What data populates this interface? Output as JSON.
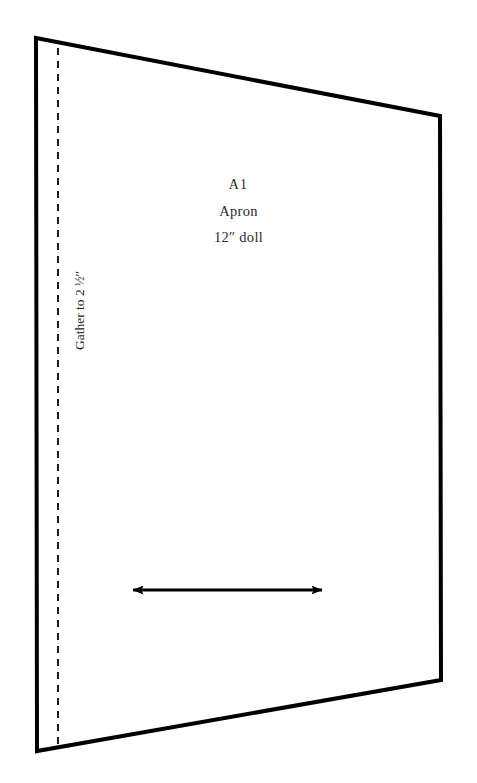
{
  "page": {
    "background_color": "#ffffff",
    "width": 477,
    "height": 783
  },
  "pattern_piece": {
    "outline_color": "#000000",
    "outline_width": 4,
    "fill_color": "#ffffff",
    "shape": "trapezoid",
    "vertices": {
      "top_left": [
        36,
        38
      ],
      "top_right": [
        440,
        116
      ],
      "bottom_right": [
        441,
        680
      ],
      "bottom_left": [
        37,
        751
      ]
    }
  },
  "labels": {
    "piece_id": "A1",
    "piece_name": "Apron",
    "size": "12″ doll"
  },
  "gather_line": {
    "note_prefix": "Gather to 2 ",
    "note_fraction": "½",
    "note_suffix": "″",
    "note_full": "Gather to 2 ½″",
    "dash_color": "#1d1d1d",
    "dash_width": 2,
    "x_position": 58,
    "dash_pattern": "7 6"
  },
  "grainline": {
    "color": "#000000",
    "line_width": 3,
    "start_x": 131,
    "end_x": 324,
    "y": 590,
    "arrowheads": "both"
  }
}
